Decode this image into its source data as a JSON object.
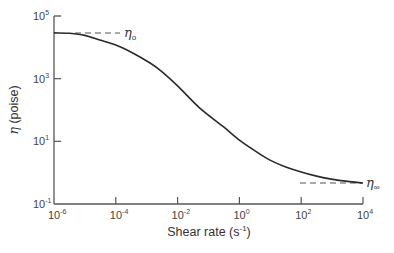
{
  "chart_data": {
    "type": "line",
    "title": "",
    "xlabel": "Shear rate (s-1)",
    "ylabel": "η (poise)",
    "xscale": "log",
    "yscale": "log",
    "xlim": [
      1e-06,
      10000.0
    ],
    "ylim": [
      0.1,
      100000.0
    ],
    "grid": false,
    "legend": null,
    "x_ticks": [
      {
        "base": "10",
        "exp": "-6",
        "log": -6
      },
      {
        "base": "10",
        "exp": "-4",
        "log": -4
      },
      {
        "base": "10",
        "exp": "-2",
        "log": -2
      },
      {
        "base": "10",
        "exp": "0",
        "log": 0
      },
      {
        "base": "10",
        "exp": "2",
        "log": 2
      },
      {
        "base": "10",
        "exp": "4",
        "log": 4
      }
    ],
    "y_ticks": [
      {
        "base": "10",
        "exp": "-1",
        "log": -1
      },
      {
        "base": "10",
        "exp": "1",
        "log": 1
      },
      {
        "base": "10",
        "exp": "3",
        "log": 3
      },
      {
        "base": "10",
        "exp": "5",
        "log": 5
      }
    ],
    "series": [
      {
        "name": "viscosity",
        "x_log": [
          -6,
          -5.5,
          -5,
          -4.52,
          -4,
          -3.5,
          -2.89,
          -2.5,
          -2,
          -1.28,
          -0.5,
          0,
          0.5,
          0.99,
          1.5,
          2,
          2.5,
          2.93,
          3.5,
          4
        ],
        "y_log": [
          4.46,
          4.45,
          4.38,
          4.23,
          4.07,
          3.84,
          3.5,
          3.22,
          2.77,
          2.06,
          1.45,
          1.04,
          0.7,
          0.4,
          0.18,
          0.02,
          -0.11,
          -0.2,
          -0.28,
          -0.33
        ],
        "x": [
          1e-06,
          3.2e-06,
          1e-05,
          3e-05,
          0.0001,
          0.00032,
          0.0013,
          0.0032,
          0.01,
          0.052,
          0.32,
          1,
          3.2,
          9.8,
          32,
          100,
          316,
          850,
          3160,
          10000.0
        ],
        "y": [
          28800,
          28200,
          24000,
          17000,
          11700,
          6900,
          3160,
          1660,
          590,
          115,
          28,
          11,
          5.0,
          2.5,
          1.5,
          1.05,
          0.78,
          0.63,
          0.52,
          0.47
        ]
      }
    ],
    "annotations": [
      {
        "text": "η",
        "sub": "o",
        "meaning": "zero-shear viscosity",
        "y_value": 28800,
        "y_log": 4.46
      },
      {
        "text": "η",
        "sub": "∞",
        "meaning": "infinite-shear viscosity",
        "y_value": 0.47,
        "y_log": -0.33
      }
    ]
  },
  "labels": {
    "xlabel_main": "Shear rate (s",
    "xlabel_sup": "-1",
    "xlabel_end": ")",
    "ylabel_sym": "η",
    "ylabel_unit": " (poise)",
    "eta0_sym": "η",
    "eta0_sub": "o",
    "etainf_sym": "η",
    "etainf_sub": "∞"
  },
  "style": {
    "curve_color": "#2a2a2a",
    "axis_color": "#555555",
    "dash_color": "#555555"
  }
}
